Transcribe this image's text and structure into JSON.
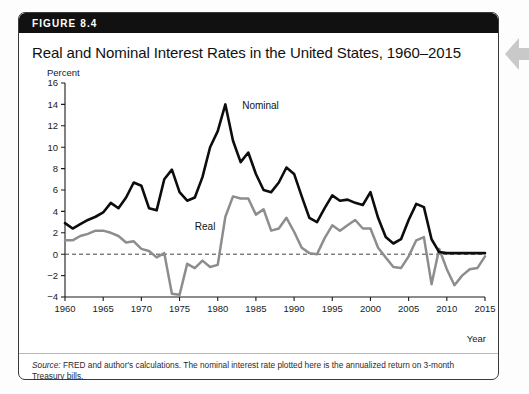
{
  "figure": {
    "label": "FIGURE 8.4",
    "title": "Real and Nominal Interest Rates in the United States, 1960–2015",
    "source_prefix": "Source:",
    "source_text": " FRED and author's calculations. The nominal interest rate plotted here is the annualized return on 3-month Treasury bills."
  },
  "colors": {
    "header_bar": "#111111",
    "nominal_line": "#0d0d0d",
    "real_line": "#8d8d8d",
    "zero_line": "#444444",
    "panel_border": "#3a3a3a",
    "page_background": "#fdfdfd",
    "arrow_marker": "#c9c9c9"
  },
  "chart_data": {
    "type": "line",
    "title": "Real and Nominal Interest Rates in the United States, 1960–2015",
    "xlabel": "Year",
    "ylabel": "Percent",
    "xlim": [
      1960,
      2015
    ],
    "ylim": [
      -4,
      16
    ],
    "ytick_step": 2,
    "xtick_step": 5,
    "yticks": [
      -4,
      -2,
      0,
      2,
      4,
      6,
      8,
      10,
      12,
      14,
      16
    ],
    "xticks": [
      1960,
      1965,
      1970,
      1975,
      1980,
      1985,
      1990,
      1995,
      2000,
      2005,
      2010,
      2015
    ],
    "grid": false,
    "legend": "inline-annotations",
    "annotations": [
      {
        "text": "Nominal",
        "year": 1983.2,
        "value": 13.6
      },
      {
        "text": "Real",
        "year": 1977.0,
        "value": 2.3
      }
    ],
    "zero_reference_line": 0,
    "x": [
      1960,
      1961,
      1962,
      1963,
      1964,
      1965,
      1966,
      1967,
      1968,
      1969,
      1970,
      1971,
      1972,
      1973,
      1974,
      1975,
      1976,
      1977,
      1978,
      1979,
      1980,
      1981,
      1982,
      1983,
      1984,
      1985,
      1986,
      1987,
      1988,
      1989,
      1990,
      1991,
      1992,
      1993,
      1994,
      1995,
      1996,
      1997,
      1998,
      1999,
      2000,
      2001,
      2002,
      2003,
      2004,
      2005,
      2006,
      2007,
      2008,
      2009,
      2010,
      2011,
      2012,
      2013,
      2014,
      2015
    ],
    "series": [
      {
        "name": "Nominal",
        "color": "#0d0d0d",
        "values": [
          2.9,
          2.4,
          2.8,
          3.2,
          3.5,
          3.9,
          4.8,
          4.3,
          5.3,
          6.7,
          6.4,
          4.3,
          4.1,
          7.0,
          7.9,
          5.8,
          5.0,
          5.3,
          7.2,
          10.0,
          11.5,
          14.0,
          10.6,
          8.6,
          9.5,
          7.5,
          6.0,
          5.8,
          6.7,
          8.1,
          7.5,
          5.4,
          3.4,
          3.0,
          4.3,
          5.5,
          5.0,
          5.1,
          4.8,
          4.6,
          5.8,
          3.4,
          1.6,
          1.0,
          1.4,
          3.2,
          4.7,
          4.4,
          1.4,
          0.2,
          0.1,
          0.1,
          0.1,
          0.1,
          0.1,
          0.1
        ]
      },
      {
        "name": "Real",
        "color": "#8d8d8d",
        "values": [
          1.3,
          1.3,
          1.7,
          1.9,
          2.2,
          2.2,
          2.0,
          1.7,
          1.1,
          1.2,
          0.5,
          0.3,
          -0.3,
          0.1,
          -3.7,
          -3.8,
          -0.9,
          -1.3,
          -0.6,
          -1.2,
          -1.0,
          3.5,
          5.4,
          5.2,
          5.2,
          3.7,
          4.2,
          2.2,
          2.4,
          3.4,
          2.1,
          0.6,
          0.1,
          0.0,
          1.5,
          2.7,
          2.2,
          2.7,
          3.2,
          2.4,
          2.4,
          0.6,
          -0.3,
          -1.2,
          -1.3,
          -0.2,
          1.3,
          1.6,
          -2.8,
          0.5,
          -1.4,
          -2.9,
          -2.0,
          -1.4,
          -1.3,
          -0.2
        ]
      }
    ]
  }
}
